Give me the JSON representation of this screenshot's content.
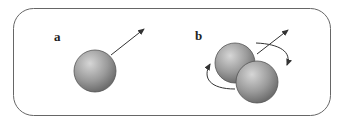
{
  "panels": [
    {
      "label": "a",
      "description": "single sphere with translation arrow"
    },
    {
      "label": "b",
      "description": "two overlapping spheres with translation arrow and rotation arrows"
    }
  ],
  "colors": {
    "frame": "#555555",
    "sphere_light": "#d0d0d0",
    "sphere_dark": "#707070",
    "arrow": "#333333"
  }
}
